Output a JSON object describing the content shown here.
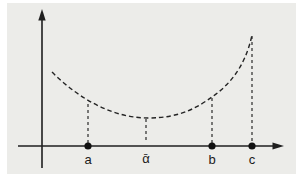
{
  "figure": {
    "type": "function-sketch",
    "colors": {
      "panel_background": "#ECECE9",
      "page_background": "#ffffff",
      "line": "#1f1f1f",
      "dot": "#111111"
    },
    "curve": {
      "style": "dashed",
      "shape": "convex, minimum at alpha-bar, rising steeply toward c"
    },
    "points": [
      {
        "label": "a",
        "has_dot": true,
        "guide_dashed": true
      },
      {
        "label": "ᾱ",
        "has_dot": false,
        "guide_dashed": true
      },
      {
        "label": "b",
        "has_dot": true,
        "guide_dashed": true
      },
      {
        "label": "c",
        "has_dot": true,
        "guide_dashed": true
      }
    ],
    "axes": {
      "x_arrow": "right",
      "y_arrow": "up",
      "tick_labels_visible": [
        "a",
        "ᾱ",
        "b",
        "c"
      ]
    }
  }
}
